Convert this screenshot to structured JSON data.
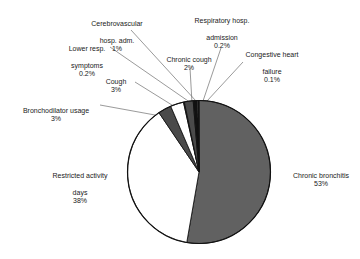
{
  "chart_data": {
    "type": "pie",
    "title": "",
    "subtitle": "",
    "xlabel": "",
    "ylabel": "",
    "legend_position": "none",
    "grid": false,
    "labels_show_percent": true,
    "categories": [
      "Chronic bronchitis",
      "Restricted activity days",
      "Bronchodilator usage",
      "Cough",
      "Lower resp. symptoms",
      "Chronic cough",
      "Cerebrovascular hosp. adm.",
      "Respiratory hosp. admission",
      "Congestive heart failure"
    ],
    "values": [
      53,
      38,
      3,
      3,
      0.2,
      2,
      1,
      0.2,
      0.1
    ],
    "value_labels": [
      "53%",
      "38%",
      "3%",
      "3%",
      "0.2%",
      "2%",
      "1%",
      "0.2%",
      "0.1%"
    ],
    "colors": [
      "#616161",
      "#ffffff",
      "#4a4a4a",
      "#ffffff",
      "#2b2b2b",
      "#4a4a4a",
      "#111111",
      "#ffffff",
      "#111111"
    ],
    "slices": [
      {
        "name": "Chronic bronchitis",
        "value": 53,
        "value_label": "53%",
        "color": "#616161"
      },
      {
        "name": "Restricted activity days",
        "value": 38,
        "value_label": "38%",
        "color": "#ffffff"
      },
      {
        "name": "Bronchodilator usage",
        "value": 3,
        "value_label": "3%",
        "color": "#4a4a4a"
      },
      {
        "name": "Cough",
        "value": 3,
        "value_label": "3%",
        "color": "#ffffff"
      },
      {
        "name": "Lower resp. symptoms",
        "value": 0.2,
        "value_label": "0.2%",
        "color": "#2b2b2b"
      },
      {
        "name": "Chronic cough",
        "value": 2,
        "value_label": "2%",
        "color": "#4a4a4a"
      },
      {
        "name": "Cerebrovascular hosp. adm.",
        "value": 1,
        "value_label": "1%",
        "color": "#111111"
      },
      {
        "name": "Respiratory hosp. admission",
        "value": 0.2,
        "value_label": "0.2%",
        "color": "#ffffff"
      },
      {
        "name": "Congestive heart failure",
        "value": 0.1,
        "value_label": "0.1%",
        "color": "#111111"
      }
    ]
  },
  "labels": {
    "cerebrovascular": {
      "line1": "Cerebrovascular",
      "line2": "hosp. adm.",
      "pct": "1%"
    },
    "respiratory_hosp": {
      "line1": "Respiratory hosp.",
      "line2": "admission",
      "pct": "0.2%"
    },
    "lower_resp": {
      "line1": "Lower resp.",
      "line2": "symptoms",
      "pct": "0.2%"
    },
    "chronic_cough": {
      "line1": "Chronic cough",
      "line2": "",
      "pct": "2%"
    },
    "congestive": {
      "line1": "Congestive heart",
      "line2": "failure",
      "pct": "0.1%"
    },
    "cough": {
      "line1": "Cough",
      "line2": "",
      "pct": "3%"
    },
    "bronchodilator": {
      "line1": "Bronchodilator usage",
      "line2": "",
      "pct": "3%"
    },
    "restricted": {
      "line1": "Restricted activity",
      "line2": "days",
      "pct": "38%"
    },
    "chronic_bronchitis": {
      "line1": "Chronic bronchitis",
      "line2": "",
      "pct": "53%"
    }
  },
  "style": {
    "background": "#ffffff",
    "outline": "#111111",
    "leader_line": "#6e6e6e",
    "slice_gray_large": "#616161",
    "slice_gray_mid": "#4a4a4a",
    "slice_black": "#111111",
    "slice_white": "#ffffff",
    "text": "#1a1a1a"
  }
}
